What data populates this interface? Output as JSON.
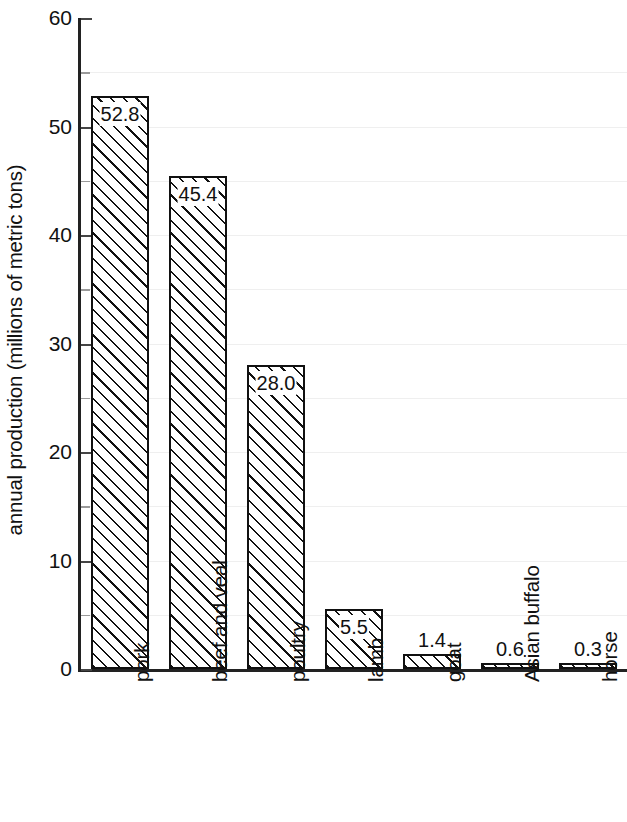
{
  "chart_data": {
    "type": "bar",
    "title": "",
    "xlabel": "",
    "ylabel": "annual production (millions of metric tons)",
    "categories": [
      "pork",
      "beef and veal",
      "poultry",
      "lamb",
      "goat",
      "Asian buffalo",
      "horse"
    ],
    "values": [
      52.8,
      45.4,
      28.0,
      5.5,
      1.4,
      0.6,
      0.3
    ],
    "value_labels": [
      "52.8",
      "45.4",
      "28.0",
      "5.5",
      "1.4",
      "0.6",
      "0.3"
    ],
    "label_placement": [
      "inside",
      "inside",
      "inside",
      "inside",
      "above",
      "above",
      "above"
    ],
    "ylim": [
      0,
      60
    ],
    "ytick_labels": [
      "0",
      "10",
      "20",
      "30",
      "40",
      "50",
      "60"
    ],
    "ytick_values": [
      0,
      10,
      20,
      30,
      40,
      50,
      60
    ],
    "yminor_values": [
      5,
      15,
      25,
      35,
      45,
      55
    ],
    "grid": true,
    "grid_axis": "y",
    "legend": "none",
    "bar_style": {
      "fill": "hatched-diagonal",
      "edge_color": "#111111",
      "face_color": "#ffffff",
      "hatch": "/"
    },
    "xtick_label_rotation": 90
  }
}
